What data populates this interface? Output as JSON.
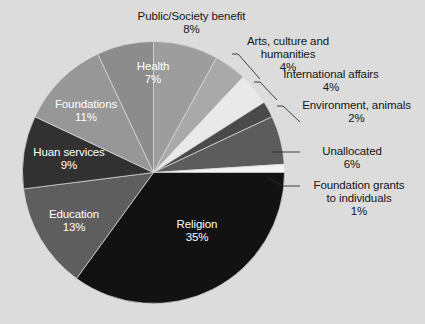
{
  "chart_data": {
    "type": "pie",
    "title": "",
    "subtitle": "",
    "xlabel": "",
    "ylabel": "",
    "legend_position": "none",
    "grid": false,
    "units": "percent",
    "start_angle_deg": 0,
    "direction": "clockwise",
    "categories": [
      "Public/Society benefit",
      "Arts, culture and humanities",
      "International affairs",
      "Environment, animals",
      "Unallocated",
      "Foundation grants to individuals",
      "Religion",
      "Education",
      "Huan services",
      "Foundations",
      "Health"
    ],
    "values": [
      8,
      4,
      4,
      2,
      6,
      1,
      35,
      13,
      9,
      11,
      7
    ],
    "colors": [
      "#9d9d9d",
      "#a9a9a9",
      "#e9e9e9",
      "#4a4a4a",
      "#5c5c5c",
      "#f4f4f4",
      "#121212",
      "#5e5e5e",
      "#313131",
      "#979797",
      "#8c8c8c"
    ],
    "slices": [
      {
        "label": "Public/Society benefit",
        "value": 8,
        "display": "8%",
        "color": "#9d9d9d",
        "label_placement": "outside"
      },
      {
        "label": "Arts, culture and humanities",
        "value": 4,
        "display": "4%",
        "color": "#a9a9a9",
        "label_placement": "outside"
      },
      {
        "label": "International affairs",
        "value": 4,
        "display": "4%",
        "color": "#e9e9e9",
        "label_placement": "outside"
      },
      {
        "label": "Environment, animals",
        "value": 2,
        "display": "2%",
        "color": "#4a4a4a",
        "label_placement": "outside"
      },
      {
        "label": "Unallocated",
        "value": 6,
        "display": "6%",
        "color": "#5c5c5c",
        "label_placement": "outside"
      },
      {
        "label": "Foundation grants to individuals",
        "value": 1,
        "display": "1%",
        "color": "#f4f4f4",
        "label_placement": "outside"
      },
      {
        "label": "Religion",
        "value": 35,
        "display": "35%",
        "color": "#121212",
        "label_placement": "inside"
      },
      {
        "label": "Education",
        "value": 13,
        "display": "13%",
        "color": "#5e5e5e",
        "label_placement": "inside"
      },
      {
        "label": "Huan services",
        "value": 9,
        "display": "9%",
        "color": "#313131",
        "label_placement": "inside"
      },
      {
        "label": "Foundations",
        "value": 11,
        "display": "11%",
        "color": "#979797",
        "label_placement": "inside"
      },
      {
        "label": "Health",
        "value": 7,
        "display": "7%",
        "color": "#8c8c8c",
        "label_placement": "inside"
      }
    ],
    "background_color": "#dcdcdc"
  },
  "labels": {
    "public_society": {
      "name": "Public/Society benefit",
      "pct": "8%"
    },
    "arts": {
      "line1": "Arts, culture and",
      "line2": "humanities",
      "pct": "4%"
    },
    "international": {
      "name": "International affairs",
      "pct": "4%"
    },
    "environment": {
      "name": "Environment, animals",
      "pct": "2%"
    },
    "unallocated": {
      "name": "Unallocated",
      "pct": "6%"
    },
    "foundation_grants": {
      "line1": "Foundation grants",
      "line2": "to individuals",
      "pct": "1%"
    },
    "religion": {
      "name": "Religion",
      "pct": "35%"
    },
    "education": {
      "name": "Education",
      "pct": "13%"
    },
    "human_services": {
      "name": "Huan services",
      "pct": "9%"
    },
    "foundations": {
      "name": "Foundations",
      "pct": "11%"
    },
    "health": {
      "name": "Health",
      "pct": "7%"
    }
  }
}
